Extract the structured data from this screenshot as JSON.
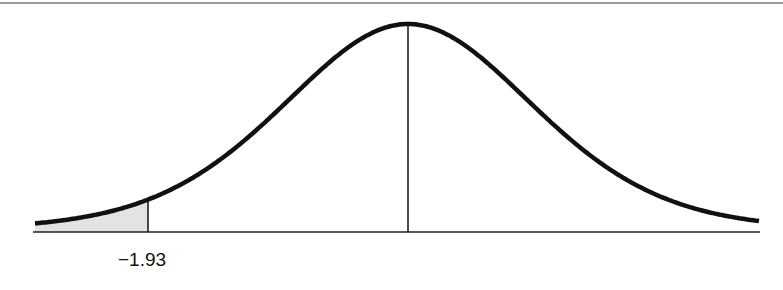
{
  "chart_data": {
    "type": "area",
    "title": "",
    "xlabel": "",
    "ylabel": "",
    "distribution": "normal",
    "mean": 0,
    "shaded_region": {
      "from": "-inf",
      "to": -1.93,
      "tail": "left"
    },
    "tick_labels": [
      "−1.93"
    ],
    "markers": [
      {
        "x": 0,
        "type": "vertical-line",
        "label": ""
      },
      {
        "x": -1.93,
        "type": "vertical-line",
        "label": "−1.93"
      }
    ],
    "grid": false,
    "legend": null
  },
  "labels": {
    "cutoff": "−1.93"
  },
  "colors": {
    "curve": "#111111",
    "shade": "#e3e3e3",
    "axis": "#222222",
    "border": "#777777"
  }
}
